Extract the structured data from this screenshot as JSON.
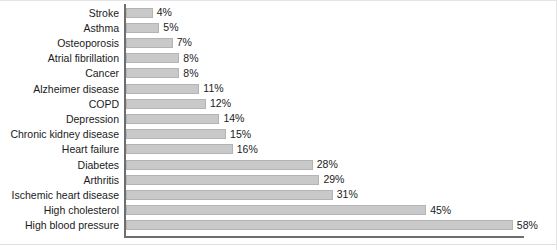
{
  "chart_data": {
    "type": "bar",
    "orientation": "horizontal",
    "title": "",
    "subtitle": "",
    "xlabel": "",
    "ylabel": "",
    "xlim": [
      0,
      60
    ],
    "grid": false,
    "legend": null,
    "value_suffix": "%",
    "categories": [
      "Stroke",
      "Asthma",
      "Osteoporosis",
      "Atrial fibrillation",
      "Cancer",
      "Alzheimer disease",
      "COPD",
      "Depression",
      "Chronic kidney disease",
      "Heart failure",
      "Diabetes",
      "Arthritis",
      "Ischemic heart disease",
      "High cholesterol",
      "High blood pressure"
    ],
    "values": [
      4,
      5,
      7,
      8,
      8,
      11,
      12,
      14,
      15,
      16,
      28,
      29,
      31,
      45,
      58
    ],
    "data_labels": [
      "4%",
      "5%",
      "7%",
      "8%",
      "8%",
      "11%",
      "12%",
      "14%",
      "15%",
      "16%",
      "28%",
      "29%",
      "31%",
      "45%",
      "58%"
    ],
    "colors": {
      "bar_fill": "#c9c9c9",
      "bar_stroke": "#b4b4b4",
      "axis": "#6e6e6e",
      "text": "#1a1a1a",
      "background": "#ffffff"
    }
  }
}
